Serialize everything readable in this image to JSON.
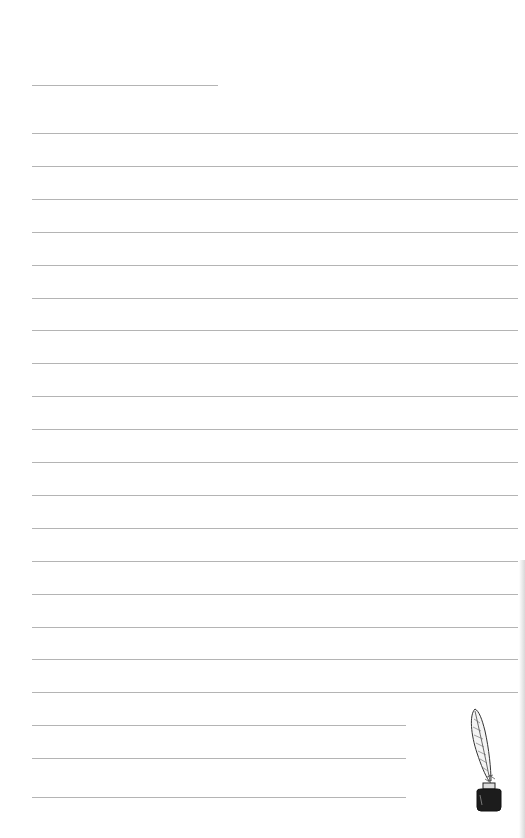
{
  "document": {
    "type": "lined-writing-paper",
    "header_line": {
      "x": 32,
      "y": 85,
      "width": 186
    },
    "full_lines": {
      "count": 18,
      "start_y": 133,
      "spacing": 32.9,
      "x": 32,
      "width": 486
    },
    "short_lines": {
      "y": [
        725,
        758,
        797
      ],
      "x": 32,
      "width": 374
    },
    "line_color": "#b4b4b4",
    "decoration": {
      "icon": "quill-inkwell-icon"
    }
  }
}
